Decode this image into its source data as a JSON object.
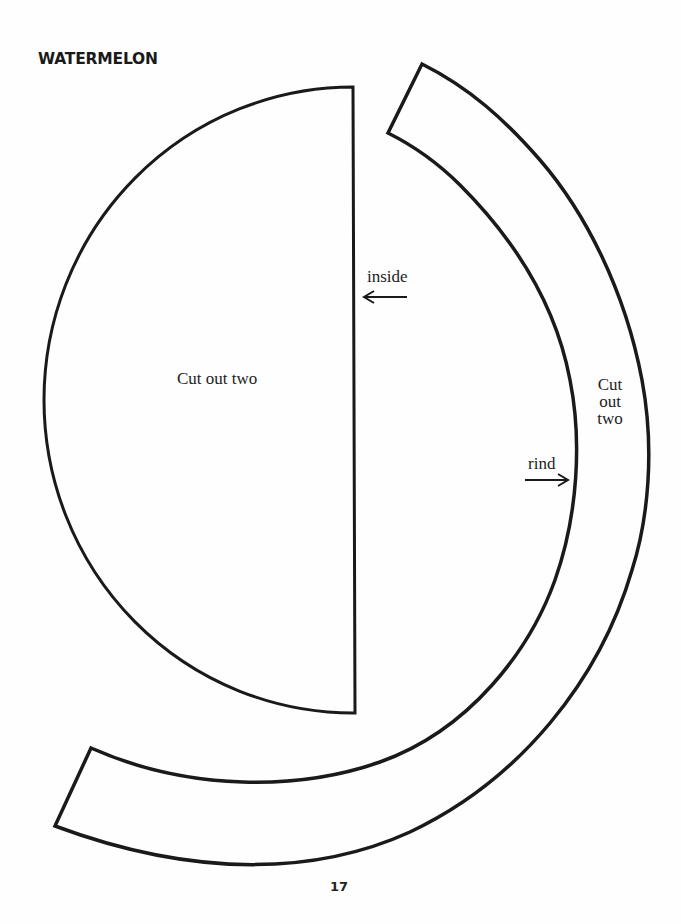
{
  "title": "WATERMELON",
  "pieces": [
    {
      "name": "inside",
      "label": "Cut out two",
      "pointer_label": "inside"
    },
    {
      "name": "rind",
      "label_lines": [
        "Cut",
        "out",
        "two"
      ],
      "pointer_label": "rind"
    }
  ],
  "page_number": "17",
  "colors": {
    "line": "#1a1a1a",
    "paper": "#fefefe"
  }
}
